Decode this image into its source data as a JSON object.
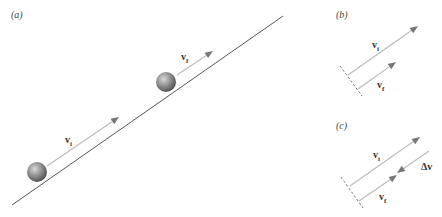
{
  "colors": {
    "background": "#ffffff",
    "incline": "#555555",
    "arrow_shaft": "#bbbbbb",
    "arrow_head": "#777777",
    "ball_light": "#bdbdbd",
    "ball_dark": "#5a5a5a",
    "dashed_line": "#555555",
    "text": "#333333"
  },
  "panels": {
    "a": {
      "label": "(a)",
      "incline": {
        "x1": 12,
        "y1": 205,
        "x2": 283,
        "y2": 16
      },
      "balls": [
        {
          "name": "ball-initial",
          "cx": 37,
          "cy": 172,
          "r": 10
        },
        {
          "name": "ball-final",
          "cx": 166,
          "cy": 82,
          "r": 10
        }
      ],
      "vectors": [
        {
          "name": "v-initial",
          "label": "v",
          "sub": "i",
          "x1": 47,
          "y1": 166,
          "x2": 119,
          "y2": 117,
          "lx": 65,
          "ly": 143
        },
        {
          "name": "v-final",
          "label": "v",
          "sub": "f",
          "x1": 177,
          "y1": 75,
          "x2": 213,
          "y2": 51,
          "lx": 181,
          "ly": 60
        }
      ]
    },
    "b": {
      "label": "(b)",
      "dashed": {
        "x1": 340,
        "y1": 66,
        "x2": 362,
        "y2": 96
      },
      "vectors": [
        {
          "name": "v-initial",
          "label": "v",
          "sub": "i",
          "x1": 348,
          "y1": 75,
          "x2": 418,
          "y2": 26,
          "lx": 372,
          "ly": 48
        },
        {
          "name": "v-final",
          "label": "v",
          "sub": "f",
          "x1": 358,
          "y1": 89,
          "x2": 396,
          "y2": 62,
          "lx": 377,
          "ly": 88
        }
      ]
    },
    "c": {
      "label": "(c)",
      "dashed": {
        "x1": 341,
        "y1": 177,
        "x2": 363,
        "y2": 208
      },
      "vectors": [
        {
          "name": "v-initial",
          "label": "v",
          "sub": "i",
          "x1": 350,
          "y1": 186,
          "x2": 420,
          "y2": 137,
          "lx": 373,
          "ly": 158
        },
        {
          "name": "v-final",
          "label": "v",
          "sub": "f",
          "x1": 359,
          "y1": 201,
          "x2": 397,
          "y2": 175,
          "lx": 379,
          "ly": 200
        },
        {
          "name": "delta-v",
          "label": "Δv",
          "sub": "",
          "x1": 429,
          "y1": 151,
          "x2": 397,
          "y2": 173,
          "lx": 421,
          "ly": 170
        }
      ]
    }
  }
}
